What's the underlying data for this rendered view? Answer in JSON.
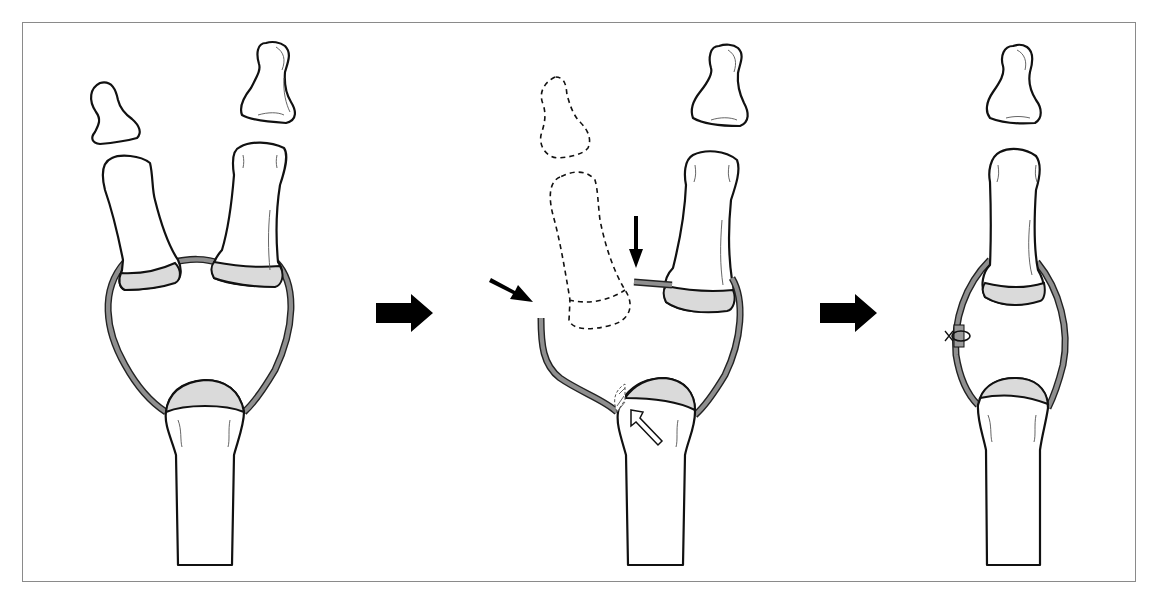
{
  "figure": {
    "panels": [
      {
        "id": "before",
        "label": "Duplicated digit: two distal and two proximal phalanges sharing one joint capsule over a metacarpal head"
      },
      {
        "id": "excision",
        "label": "Radial digit excised (dashed outline); ligament cut (black arrows); metacarpal head shaved (open arrow)"
      },
      {
        "id": "after",
        "label": "Single digit; collateral ligament reattached with suture"
      }
    ],
    "arrows": [
      {
        "from": "before",
        "to": "excision",
        "icon": "right-arrow-icon"
      },
      {
        "from": "excision",
        "to": "after",
        "icon": "right-arrow-icon"
      }
    ],
    "colors": {
      "outline": "#111111",
      "cartilage": "#dadada",
      "ligament": "#8f8f8f",
      "frame": "#8a8a8a"
    }
  }
}
